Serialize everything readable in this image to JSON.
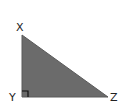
{
  "diagram": {
    "type": "right-triangle",
    "fill_color": "#6b6b6b",
    "stroke_color": "#5a5a5a",
    "label_color": "#222222",
    "right_angle_at": "Y",
    "vertices": [
      {
        "label": "X",
        "position": "top-left"
      },
      {
        "label": "Y",
        "position": "bottom-left"
      },
      {
        "label": "Z",
        "position": "bottom-right"
      }
    ],
    "labels": {
      "x": "X",
      "y": "Y",
      "z": "Z"
    }
  }
}
